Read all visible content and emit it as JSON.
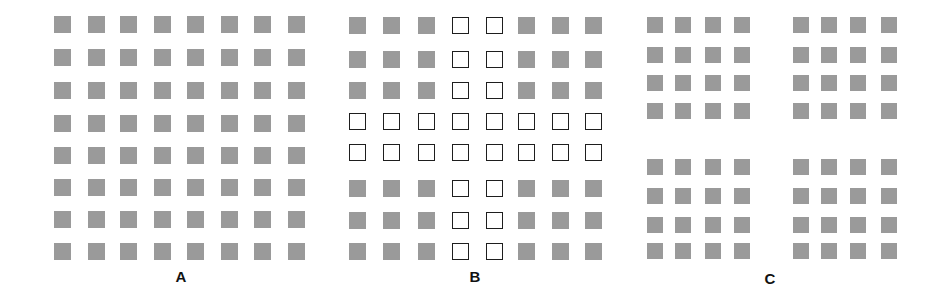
{
  "figure": {
    "colors": {
      "filled": "#9a9a9a",
      "outline": "#1e1e1e",
      "background": "#ffffff"
    },
    "panels": [
      {
        "id": "A",
        "label": "A",
        "description": "8x8 uniform grid of filled gray squares",
        "rows": 8,
        "cols": 8,
        "outlined_rows": [],
        "outlined_cols": [],
        "col_x": [
          54,
          88,
          120,
          154,
          187,
          221,
          254,
          288
        ],
        "row_y": [
          16,
          49,
          82,
          115,
          147,
          179,
          211,
          243
        ],
        "label_pos": [
          181,
          276
        ]
      },
      {
        "id": "B",
        "label": "B",
        "description": "8x8 grid; rows 4-5 and columns 4-5 are open (outlined) squares forming a cross, the rest are filled gray",
        "rows": 8,
        "cols": 8,
        "outlined_rows": [
          3,
          4
        ],
        "outlined_cols": [
          3,
          4
        ],
        "col_x": [
          349,
          383,
          418,
          452,
          486,
          518,
          552,
          585
        ],
        "row_y": [
          17,
          51,
          82,
          113,
          144,
          180,
          212,
          243
        ],
        "label_pos": [
          475,
          276
        ]
      },
      {
        "id": "C",
        "label": "C",
        "description": "Four separated 4x4 blocks of filled gray squares (2x2 arrangement of blocks)",
        "rows": 8,
        "cols": 8,
        "outlined_rows": [],
        "outlined_cols": [],
        "col_x": [
          647,
          675,
          705,
          734,
          793,
          821,
          850,
          881
        ],
        "row_y": [
          17,
          47,
          75,
          103,
          159,
          188,
          217,
          243
        ],
        "label_pos": [
          770,
          278
        ]
      }
    ]
  }
}
